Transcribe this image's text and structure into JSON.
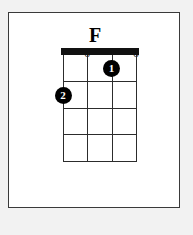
{
  "diagram": {
    "type": "guitar-chord-diagram",
    "chord_name": "F",
    "instrument_strings": 4,
    "fret_count": 4,
    "starting_fret": 1,
    "nut_shown": true,
    "background_color": "#f2f2f2",
    "card_color": "#ffffff",
    "ink_color": "#000000",
    "string_positions_pct": [
      0,
      33.3,
      66.6,
      100
    ],
    "fret_positions_pct": [
      25,
      50,
      75,
      100
    ],
    "open_markers": [
      {
        "label": "o",
        "string_index": 1,
        "left_pct": 33.3
      },
      {
        "label": "o",
        "string_index": 3,
        "left_pct": 100
      }
    ],
    "finger_dots": [
      {
        "label": "1",
        "string_index": 2,
        "fret": 1,
        "left_pct": 66.6,
        "top_pct": 12.5
      },
      {
        "label": "2",
        "string_index": 0,
        "fret": 2,
        "left_pct": 0,
        "top_pct": 37.5
      }
    ]
  }
}
